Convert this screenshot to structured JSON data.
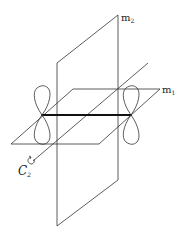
{
  "figure": {
    "labels": {
      "plane_vertical": {
        "main": "m",
        "sub": "2"
      },
      "plane_horizontal": {
        "main": "m",
        "sub": "1"
      },
      "axis": {
        "main": "C",
        "sub": "2"
      }
    },
    "elements": [
      "mirror-plane-m1",
      "mirror-plane-m2",
      "c2-rotation-axis",
      "bond",
      "p-orbital-left",
      "p-orbital-right"
    ]
  }
}
